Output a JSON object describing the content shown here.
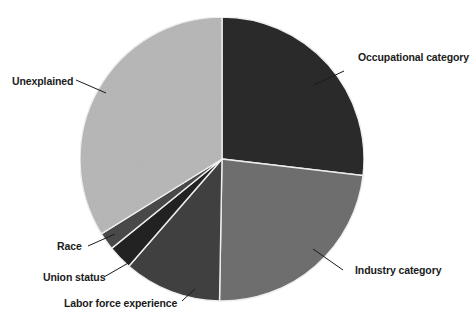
{
  "chart_data": {
    "type": "pie",
    "title": "",
    "subtitle": "",
    "xlabel": "",
    "ylabel": "",
    "legend_position": "callout-labels",
    "grid": false,
    "center": {
      "x": 222,
      "y": 159
    },
    "radius": 142,
    "start_angle_deg": 0,
    "direction": "clockwise",
    "categories": [
      "Occupational category",
      "Industry category",
      "Labor force experience",
      "Union status",
      "Race",
      "Unexplained"
    ],
    "values": [
      26.9,
      23.4,
      11.1,
      2.8,
      2.0,
      33.8
    ],
    "units": "percent",
    "slices": [
      {
        "label": "Occupational category",
        "value": 26.9,
        "start_deg": 0.0,
        "end_deg": 96.7,
        "color": "#2b2b2b",
        "label_position": "right-top"
      },
      {
        "label": "Industry category",
        "value": 23.4,
        "start_deg": 96.7,
        "end_deg": 181.0,
        "color": "#707070",
        "label_position": "right-bottom"
      },
      {
        "label": "Labor force experience",
        "value": 11.1,
        "start_deg": 181.0,
        "end_deg": 221.0,
        "color": "#414141",
        "label_position": "bottom-left"
      },
      {
        "label": "Union status",
        "value": 2.8,
        "start_deg": 221.0,
        "end_deg": 231.0,
        "color": "#242424",
        "label_position": "left-bottom"
      },
      {
        "label": "Race",
        "value": 2.0,
        "start_deg": 231.0,
        "end_deg": 238.2,
        "color": "#4a4a4a",
        "label_position": "left"
      },
      {
        "label": "Unexplained",
        "value": 33.8,
        "start_deg": 238.2,
        "end_deg": 360.0,
        "color": "#b9b9b9",
        "label_position": "left-top"
      }
    ],
    "annotations": [
      {
        "text": "Occupational category",
        "leader_from": {
          "x": 344,
          "y": 71
        },
        "leader_to": {
          "x": 314,
          "y": 85
        }
      },
      {
        "text": "Industry category",
        "leader_from": {
          "x": 343,
          "y": 270
        },
        "leader_to": {
          "x": 313,
          "y": 249
        }
      },
      {
        "text": "Unexplained",
        "leader_from": {
          "x": 76,
          "y": 80
        },
        "leader_to": {
          "x": 106,
          "y": 93
        }
      },
      {
        "text": "Race",
        "leader_from": {
          "x": 88,
          "y": 246
        },
        "leader_to": {
          "x": 115,
          "y": 234
        }
      },
      {
        "text": "Union status",
        "leader_from": {
          "x": 104,
          "y": 277
        },
        "leader_to": {
          "x": 130,
          "y": 262
        }
      },
      {
        "text": "Labor force experience",
        "leader_from": {
          "x": 182,
          "y": 301
        },
        "leader_to": {
          "x": 195,
          "y": 289
        }
      }
    ]
  },
  "figure": {
    "background_color": "#ffffff",
    "separator_color": "#f2f2f2",
    "label_color": "#1b1b1b",
    "caption": ""
  },
  "labels": {
    "occupational": "Occupational category",
    "industry": "Industry category",
    "labor_force": "Labor force experience",
    "union_status": "Union status",
    "race": "Race",
    "unexplained": "Unexplained"
  }
}
